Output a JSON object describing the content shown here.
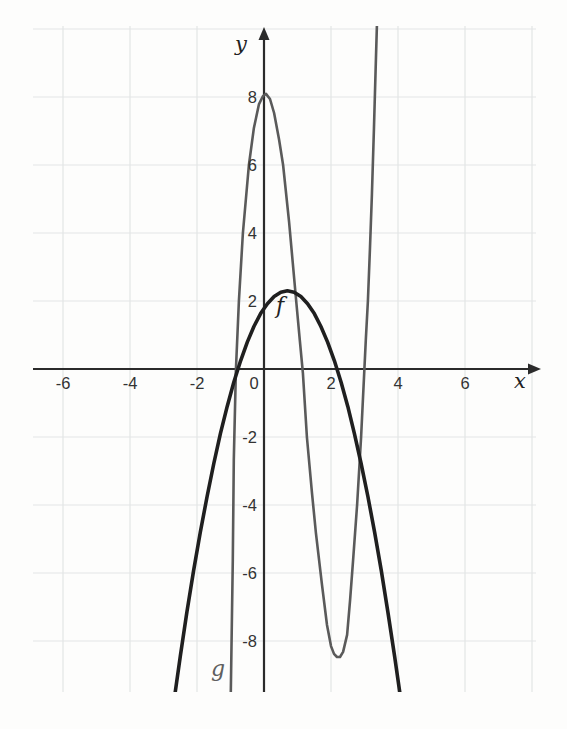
{
  "figure": {
    "background": "#fdfdfc",
    "description_labels": {
      "x_axis": "x",
      "y_axis": "y",
      "curve_f": "f",
      "curve_g": "g"
    }
  },
  "chart_data": {
    "type": "line",
    "title": "",
    "xlabel": "x",
    "ylabel": "y",
    "xlim": [
      -7.0,
      8.3
    ],
    "ylim": [
      -9.6,
      10.3
    ],
    "legend": "none",
    "grid": {
      "on": true,
      "step": 2,
      "color": "#e3e6e5",
      "x_lines": [
        -6,
        -4,
        -2,
        2,
        4,
        6,
        8
      ],
      "y_lines": [
        -8,
        -6,
        -4,
        -2,
        2,
        4,
        6,
        8,
        10
      ]
    },
    "axis_color": "#2b2b2b",
    "tick_color": "#333333",
    "x_tick_labels": [
      {
        "v": -6,
        "t": "-6"
      },
      {
        "v": -4,
        "t": "-4"
      },
      {
        "v": -2,
        "t": "-2"
      },
      {
        "v": 0,
        "t": "0"
      },
      {
        "v": 2,
        "t": "2"
      },
      {
        "v": 4,
        "t": "4"
      },
      {
        "v": 6,
        "t": "6"
      }
    ],
    "y_tick_labels": [
      {
        "v": 8,
        "t": "8"
      },
      {
        "v": 6,
        "t": "6"
      },
      {
        "v": 4,
        "t": "4"
      },
      {
        "v": 2,
        "t": "2"
      },
      {
        "v": -2,
        "t": "-2"
      },
      {
        "v": -4,
        "t": "-4"
      },
      {
        "v": -6,
        "t": "-6"
      },
      {
        "v": -8,
        "t": "-8"
      }
    ],
    "series": [
      {
        "name": "g",
        "label": "g",
        "color": "#5a5a5a",
        "label_color": "#5f5f5f",
        "stroke_width": 2.6,
        "label_pos": [
          -1.37,
          -9.03
        ],
        "key_features": {
          "local_max": [
            0,
            8
          ],
          "local_min": [
            2.2,
            -8.5
          ],
          "x_intercepts": [
            -0.85,
            1.15,
            3.05
          ],
          "y_intercept": 8
        },
        "points": [
          [
            -0.99,
            -9.5
          ],
          [
            -0.93,
            -5.62
          ],
          [
            -0.9,
            -2.68
          ],
          [
            -0.84,
            -0.03
          ],
          [
            -0.75,
            2.0
          ],
          [
            -0.63,
            4.0
          ],
          [
            -0.45,
            6.0
          ],
          [
            -0.3,
            7.09
          ],
          [
            -0.15,
            7.79
          ],
          [
            -0.03,
            8.03
          ],
          [
            0.06,
            8.09
          ],
          [
            0.18,
            7.94
          ],
          [
            0.3,
            7.53
          ],
          [
            0.45,
            6.74
          ],
          [
            0.57,
            6.0
          ],
          [
            0.75,
            4.32
          ],
          [
            0.96,
            2.0
          ],
          [
            1.07,
            0.85
          ],
          [
            1.16,
            -0.12
          ],
          [
            1.28,
            -2.0
          ],
          [
            1.43,
            -3.62
          ],
          [
            1.55,
            -4.82
          ],
          [
            1.73,
            -6.35
          ],
          [
            1.88,
            -7.53
          ],
          [
            2.0,
            -8.15
          ],
          [
            2.09,
            -8.38
          ],
          [
            2.18,
            -8.47
          ],
          [
            2.27,
            -8.47
          ],
          [
            2.36,
            -8.32
          ],
          [
            2.48,
            -7.82
          ],
          [
            2.57,
            -6.79
          ],
          [
            2.66,
            -5.62
          ],
          [
            2.78,
            -4.0
          ],
          [
            2.9,
            -2.0
          ],
          [
            2.99,
            -0.12
          ],
          [
            3.04,
            0.85
          ],
          [
            3.1,
            2.0
          ],
          [
            3.16,
            3.5
          ],
          [
            3.22,
            5.12
          ],
          [
            3.28,
            7.03
          ],
          [
            3.34,
            9.09
          ],
          [
            3.37,
            10.09
          ]
        ]
      },
      {
        "name": "f",
        "label": "f",
        "color": "#1f1f1f",
        "label_color": "#222222",
        "stroke_width": 3.6,
        "label_pos": [
          0.48,
          1.65
        ],
        "key_features": {
          "vertex": [
            0.7,
            2.3
          ],
          "x_intercepts": [
            -0.78,
            2.18
          ],
          "y_intercept": 1.8
        },
        "points": [
          [
            -2.7,
            -9.84
          ],
          [
            -2.5,
            -8.45
          ],
          [
            -2.3,
            -7.15
          ],
          [
            -2.1,
            -5.93
          ],
          [
            -1.9,
            -4.8
          ],
          [
            -1.7,
            -3.75
          ],
          [
            -1.5,
            -2.78
          ],
          [
            -1.3,
            -1.9
          ],
          [
            -1.1,
            -1.1
          ],
          [
            -0.9,
            -0.39
          ],
          [
            -0.7,
            0.24
          ],
          [
            -0.5,
            0.79
          ],
          [
            -0.3,
            1.25
          ],
          [
            -0.1,
            1.63
          ],
          [
            0.1,
            1.92
          ],
          [
            0.3,
            2.13
          ],
          [
            0.5,
            2.26
          ],
          [
            0.7,
            2.3
          ],
          [
            0.9,
            2.26
          ],
          [
            1.1,
            2.13
          ],
          [
            1.3,
            1.92
          ],
          [
            1.5,
            1.63
          ],
          [
            1.7,
            1.25
          ],
          [
            1.9,
            0.79
          ],
          [
            2.1,
            0.24
          ],
          [
            2.3,
            -0.39
          ],
          [
            2.5,
            -1.1
          ],
          [
            2.7,
            -1.9
          ],
          [
            2.9,
            -2.78
          ],
          [
            3.1,
            -3.75
          ],
          [
            3.3,
            -4.8
          ],
          [
            3.5,
            -5.93
          ],
          [
            3.7,
            -7.15
          ],
          [
            3.9,
            -8.45
          ],
          [
            4.1,
            -9.84
          ]
        ]
      }
    ],
    "layout": {
      "canvas_px": [
        567,
        729
      ],
      "origin_px": [
        264,
        369
      ],
      "unit_px": [
        33.5,
        34
      ],
      "grid_bounds_px": {
        "left": 33,
        "right": 536,
        "top": 26,
        "bottom": 692
      },
      "x_axis_px": {
        "from": 33,
        "to": 530,
        "arrow_tip": 541
      },
      "y_axis_px": {
        "from": 692,
        "to": 40,
        "arrow_tip": 27
      },
      "xlabel_px": [
        520,
        388
      ],
      "ylabel_px": [
        241,
        51
      ],
      "tick_font_px": 16.5,
      "axis_letter_font_px": 21,
      "curve_label_font_px": 22
    }
  }
}
